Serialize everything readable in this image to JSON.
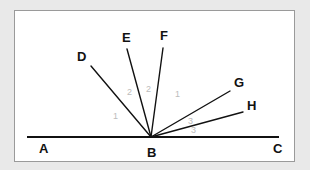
{
  "figure": {
    "type": "geometry-angle-diagram",
    "background_color": "#e9e9e9",
    "panel_color": "#ffffff",
    "panel_border_color": "#9a9a9a",
    "line_color": "#111111",
    "angle_label_color": "#bcbcbc"
  },
  "points": {
    "A": {
      "label": "A",
      "label_x": 24,
      "label_y": 142,
      "x": 12,
      "y": 126
    },
    "B": {
      "label": "B",
      "label_x": 132,
      "label_y": 146,
      "x": 136,
      "y": 126
    },
    "C": {
      "label": "C",
      "label_x": 258,
      "label_y": 142,
      "x": 264,
      "y": 126
    },
    "D": {
      "label": "D",
      "label_x": 62,
      "label_y": 50,
      "x": 76,
      "y": 55
    },
    "E": {
      "label": "E",
      "label_x": 107,
      "label_y": 31,
      "x": 112,
      "y": 38
    },
    "F": {
      "label": "F",
      "label_x": 145,
      "label_y": 29,
      "x": 148,
      "y": 37
    },
    "G": {
      "label": "G",
      "label_x": 219,
      "label_y": 76,
      "x": 215,
      "y": 80
    },
    "H": {
      "label": "H",
      "label_x": 232,
      "label_y": 99,
      "x": 228,
      "y": 101
    }
  },
  "base_line": {
    "name": "line-AC",
    "from": "A",
    "to": "C",
    "x1": 12,
    "y1": 126,
    "x2": 264,
    "y2": 126
  },
  "rays": [
    {
      "name": "ray-BD",
      "from": "B",
      "to": "D",
      "x1": 136,
      "y1": 126,
      "x2": 76,
      "y2": 55
    },
    {
      "name": "ray-BE",
      "from": "B",
      "to": "E",
      "x1": 136,
      "y1": 126,
      "x2": 112,
      "y2": 38
    },
    {
      "name": "ray-BF",
      "from": "B",
      "to": "F",
      "x1": 136,
      "y1": 126,
      "x2": 148,
      "y2": 37
    },
    {
      "name": "ray-BG",
      "from": "B",
      "to": "G",
      "x1": 136,
      "y1": 126,
      "x2": 215,
      "y2": 80
    },
    {
      "name": "ray-BH",
      "from": "B",
      "to": "H",
      "x1": 136,
      "y1": 126,
      "x2": 228,
      "y2": 101
    }
  ],
  "angle_labels": [
    {
      "name": "angle-label-ABD",
      "text": "1",
      "x": 98,
      "y": 108,
      "between": "A-D"
    },
    {
      "name": "angle-label-DBE",
      "text": "2",
      "x": 112,
      "y": 84,
      "between": "D-E"
    },
    {
      "name": "angle-label-EBF",
      "text": "2",
      "x": 131,
      "y": 81,
      "between": "E-F"
    },
    {
      "name": "angle-label-FBG",
      "text": "1",
      "x": 160,
      "y": 86,
      "between": "F-G"
    },
    {
      "name": "angle-label-GBH",
      "text": "3",
      "x": 173,
      "y": 113,
      "between": "G-H"
    },
    {
      "name": "angle-label-HBC",
      "text": "3",
      "x": 176,
      "y": 122,
      "between": "H-C"
    }
  ]
}
